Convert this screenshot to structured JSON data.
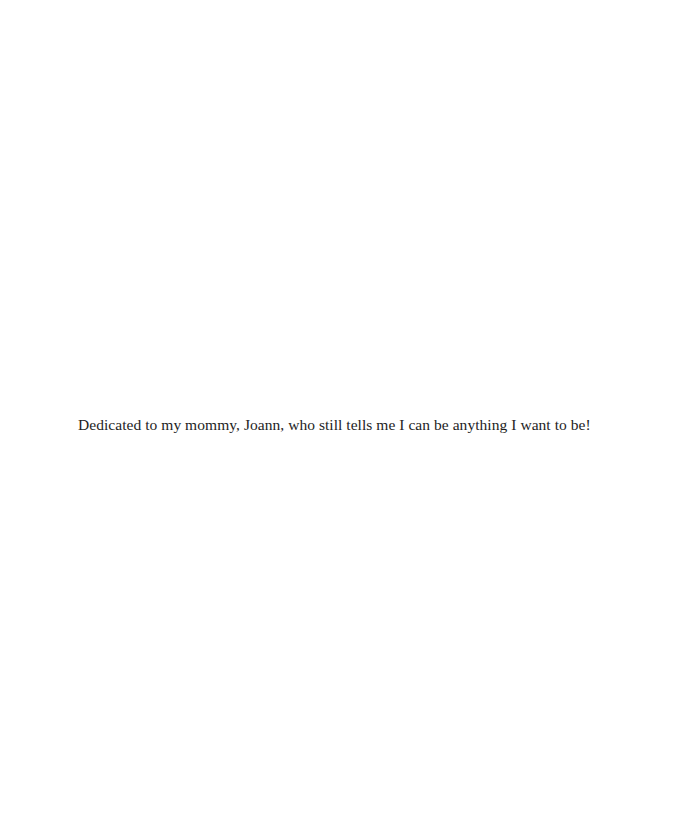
{
  "page": {
    "dedication": "Dedicated to my mommy, Joann, who still tells me I can be anything I want to be!"
  }
}
